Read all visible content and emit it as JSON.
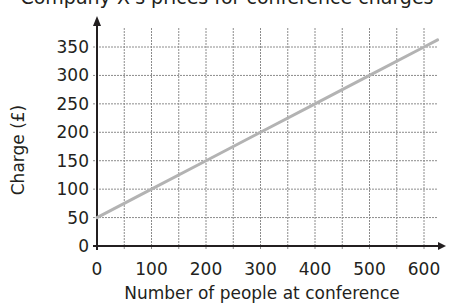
{
  "chart_data": {
    "type": "line",
    "title": "Company X's prices for conference charges",
    "xlabel": "Number of people at conference",
    "ylabel": "Charge (£)",
    "x_ticks": [
      0,
      100,
      200,
      300,
      400,
      500,
      600
    ],
    "y_ticks": [
      0,
      50,
      100,
      150,
      200,
      250,
      300,
      350
    ],
    "xlim": [
      0,
      600
    ],
    "ylim": [
      0,
      350
    ],
    "grid": true,
    "grid_minor_x_step": 50,
    "grid_y_step": 50,
    "series": [
      {
        "name": "Charge",
        "color": "#b3b3b3",
        "x": [
          0,
          100,
          200,
          300,
          400,
          500,
          600,
          625
        ],
        "y": [
          50,
          100,
          150,
          200,
          250,
          300,
          350,
          362.5
        ]
      }
    ],
    "relationship": "charge = 50 + 0.5 × people"
  },
  "colors": {
    "axis": "#231f20",
    "grid": "#8c8c8c",
    "line": "#b3b3b3"
  }
}
